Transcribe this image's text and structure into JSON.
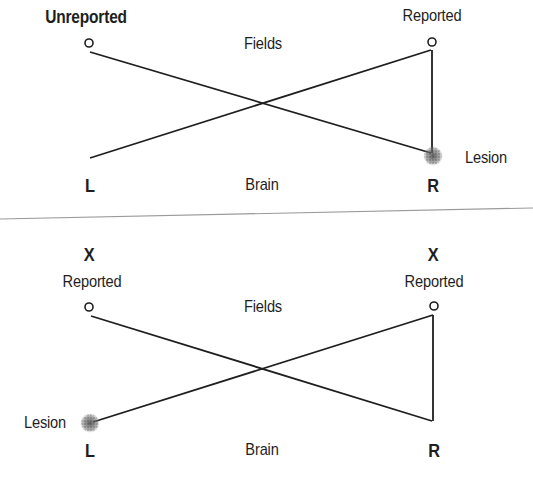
{
  "top_panel": {
    "left_field_label": "Unreported",
    "right_field_label": "Reported",
    "fields_label": "Fields",
    "brain_label": "Brain",
    "left_hemisphere": "L",
    "right_hemisphere": "R",
    "lesion_label": "Lesion",
    "lesion_side": "R"
  },
  "bottom_panel": {
    "left_marker": "X",
    "right_marker": "X",
    "left_field_label": "Reported",
    "right_field_label": "Reported",
    "fields_label": "Fields",
    "brain_label": "Brain",
    "left_hemisphere": "L",
    "right_hemisphere": "R",
    "lesion_label": "Lesion",
    "lesion_side": "L"
  },
  "colors": {
    "line": "#1e1e1e",
    "separator": "#9a9a9a",
    "lesion": "#6a6a6a"
  }
}
